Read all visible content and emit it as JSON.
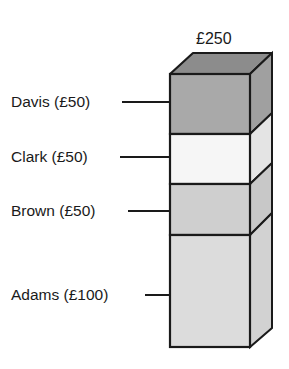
{
  "diagram": {
    "total_label": "£250",
    "segments": [
      {
        "name": "Davis",
        "amount": "£50",
        "label": "Davis (£50)",
        "fill": "#a9a9a9"
      },
      {
        "name": "Clark",
        "amount": "£50",
        "label": "Clark (£50)",
        "fill": "#f6f6f6"
      },
      {
        "name": "Brown",
        "amount": "£50",
        "label": "Brown (£50)",
        "fill": "#cfcfcf"
      },
      {
        "name": "Adams",
        "amount": "£100",
        "label": "Adams (£100)",
        "fill": "#dcdcdc"
      }
    ],
    "top_face_fill": "#8c8c8c",
    "side_face_fill": "#c4c4c4",
    "edge_color": "#1a1a1a"
  }
}
